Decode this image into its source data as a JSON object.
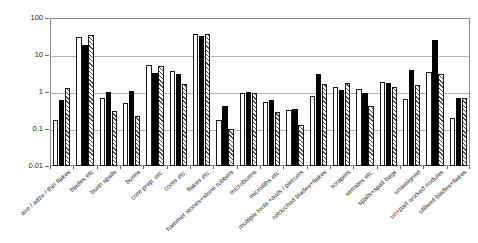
{
  "chart_data": {
    "type": "bar",
    "title": "",
    "subtitle": "",
    "xlabel": "",
    "ylabel": "",
    "yscale": "log",
    "ylim": [
      0.01,
      100
    ],
    "ytick_labels": [
      "100",
      "10",
      "1",
      "0.1",
      "0.01"
    ],
    "ytick_values": [
      100,
      10,
      1,
      0.1,
      0.01
    ],
    "grid": true,
    "legend": "none",
    "orientation": "vertical",
    "categories": [
      "axe / adze / thin flakes",
      "blades etc",
      "burin spalls",
      "burins",
      "core prep. etc.",
      "cores etc.",
      "flakes etc.",
      "hammer stones+stone rubbers",
      "microburins",
      "microliths etc.",
      "multiple tools +awls / piercers",
      "retouched blades+flakes",
      "scrapers",
      "serrates etc.",
      "spalls+spall bags",
      "unassigned",
      "un+part worked nodules",
      "utilised blades+flakes"
    ],
    "series": [
      {
        "name": "series-1-white",
        "fill": "white-outlined",
        "values": [
          0.17,
          30,
          0.68,
          0.5,
          5.5,
          3.6,
          38,
          0.18,
          0.95,
          0.55,
          0.33,
          0.8,
          1.4,
          1.2,
          1.9,
          0.63,
          3.5,
          0.2
        ]
      },
      {
        "name": "series-2-black",
        "fill": "solid-black",
        "values": [
          0.6,
          19,
          1.0,
          1.05,
          3.2,
          3.0,
          33,
          0.42,
          1.0,
          0.6,
          0.35,
          3.0,
          1.1,
          0.95,
          1.8,
          4.0,
          25,
          0.7
        ]
      },
      {
        "name": "series-3-hatched",
        "fill": "grey-hatched",
        "values": [
          1.25,
          35,
          0.3,
          0.22,
          5.0,
          1.6,
          38,
          0.1,
          0.95,
          0.28,
          0.125,
          1.6,
          1.7,
          0.42,
          1.35,
          1.55,
          3.0,
          0.7
        ]
      }
    ],
    "colors": {
      "series_1": "#ffffff",
      "series_2": "#000000",
      "series_3": "#4d4d4d",
      "axis": "#8c8c8c",
      "grid": "#b4b4b4",
      "text": "#262626",
      "background": "#ffffff"
    }
  }
}
